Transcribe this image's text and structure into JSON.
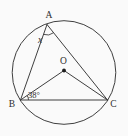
{
  "figure": {
    "background_color": "#fafafa",
    "stroke_color": "#3f3f3f",
    "text_color": "#2e2e2e",
    "dot_color": "#1e1e1e",
    "circle": {
      "cx": 64,
      "cy": 72.5,
      "r": 51.8
    },
    "points": {
      "A": {
        "x": 47,
        "y": 24.5
      },
      "B": {
        "x": 20.5,
        "y": 100
      },
      "C": {
        "x": 107.5,
        "y": 100
      },
      "O": {
        "x": 64,
        "y": 70.5
      }
    },
    "center_dot": {
      "point": "O",
      "r": 1.9
    },
    "segments": [
      {
        "name": "chord-AB",
        "from": "A",
        "to": "B"
      },
      {
        "name": "chord-AC",
        "from": "A",
        "to": "C"
      },
      {
        "name": "chord-BC",
        "from": "B",
        "to": "C"
      },
      {
        "name": "radius-OB",
        "from": "O",
        "to": "B"
      },
      {
        "name": "radius-OC",
        "from": "O",
        "to": "C"
      }
    ],
    "angle_marks": [
      {
        "name": "angle-arc-at-A",
        "path": "M43.5 34.4 A10.5 10.5 0 0 0 53.6 32.7"
      },
      {
        "name": "angle-arc-at-B",
        "path": "M28.5 100 A8 8 0 0 0 27.1 95.5"
      }
    ],
    "labels": [
      {
        "name": "label-point-A",
        "text": "A",
        "x": 49,
        "y": 18,
        "size": 9.5,
        "italic": false,
        "anchor": "middle"
      },
      {
        "name": "label-point-B",
        "text": "B",
        "x": 12,
        "y": 107,
        "size": 9.5,
        "italic": false,
        "anchor": "middle"
      },
      {
        "name": "label-point-C",
        "text": "C",
        "x": 113.5,
        "y": 107,
        "size": 9.5,
        "italic": false,
        "anchor": "middle"
      },
      {
        "name": "label-center-O",
        "text": "O",
        "x": 63.5,
        "y": 64,
        "size": 9.5,
        "italic": false,
        "anchor": "middle"
      },
      {
        "name": "label-angle-x",
        "text": "x",
        "x": 40,
        "y": 43,
        "size": 9.5,
        "italic": true,
        "anchor": "middle"
      },
      {
        "name": "label-angle-38",
        "text": "38°",
        "x": 28,
        "y": 97.5,
        "size": 8.5,
        "italic": false,
        "anchor": "start"
      }
    ]
  }
}
